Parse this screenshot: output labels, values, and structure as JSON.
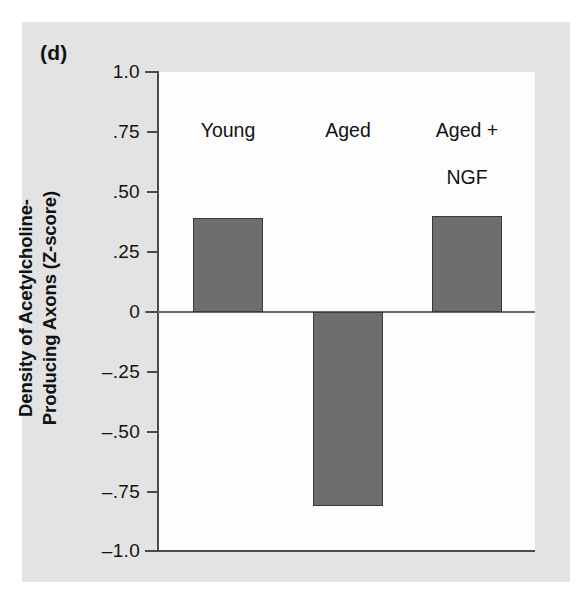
{
  "figure": {
    "panel_label": "(d)",
    "background_color": "#e3e3e3",
    "plot_background_color": "#fdfdfd",
    "bar_fill_color": "#6e6e6e",
    "bar_edge_color": "#3a3a3a",
    "axis_color": "#4a4a4a"
  },
  "chart_data": {
    "type": "bar",
    "title": "(d)",
    "subtitle": "",
    "xlabel": "",
    "ylabel": "Density of Acetylcholine-Producing Axons (Z-score)",
    "ylabel_lines": [
      "Density of Acetylcholine-",
      "Producing Axons (Z-score)"
    ],
    "categories": [
      "Young",
      "Aged",
      "Aged + NGF"
    ],
    "category_label_lines": [
      [
        "Young"
      ],
      [
        "Aged"
      ],
      [
        "Aged +",
        "NGF"
      ]
    ],
    "values": [
      0.39,
      -0.81,
      0.4
    ],
    "ylim": [
      -1.0,
      1.0
    ],
    "yticks": [
      1.0,
      0.75,
      0.5,
      0.25,
      0,
      -0.25,
      -0.5,
      -0.75,
      -1.0
    ],
    "ytick_labels": [
      "1.0",
      ".75",
      ".50",
      ".25",
      "0",
      "–.25",
      "–.50",
      "–.75",
      "–1.0"
    ],
    "grid": false,
    "legend": false,
    "legend_position": "none",
    "zero_line": true,
    "annotations": []
  }
}
